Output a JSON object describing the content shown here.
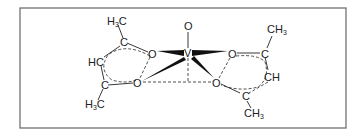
{
  "diagram": {
    "type": "chemical-structure",
    "frame_color": "#666666",
    "ink_color": "#222222",
    "atoms": {
      "vanadium": "V",
      "oxo": "O",
      "left_ring": {
        "top_methyl": {
          "main": "H",
          "sub": "3",
          "tail": "C"
        },
        "top_carbon": "C",
        "top_oxygen": "O",
        "middle_ch": "HC",
        "bottom_carbon": "C",
        "bottom_oxygen": "O",
        "bottom_methyl": {
          "main": "H",
          "sub": "3",
          "tail": "C"
        }
      },
      "right_ring": {
        "top_oxygen": "O",
        "top_carbon": "C",
        "top_methyl": {
          "main": "CH",
          "sub": "3"
        },
        "middle_ch": "CH",
        "bottom_oxygen": "O",
        "bottom_carbon": "C",
        "bottom_methyl": {
          "main": "CH",
          "sub": "3"
        }
      }
    }
  }
}
